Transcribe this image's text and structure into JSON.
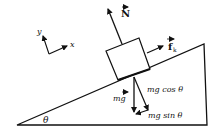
{
  "diagram": {
    "labels": {
      "normal_force": "N",
      "kinetic_friction": "f",
      "kinetic_friction_sub": "k",
      "weight": "mg",
      "weight_perp": "mg cos θ",
      "weight_parallel": "mg sin θ",
      "angle": "θ",
      "axis_x": "x",
      "axis_y": "y"
    },
    "colors": {
      "line": "#111111",
      "background": "#ffffff"
    }
  }
}
